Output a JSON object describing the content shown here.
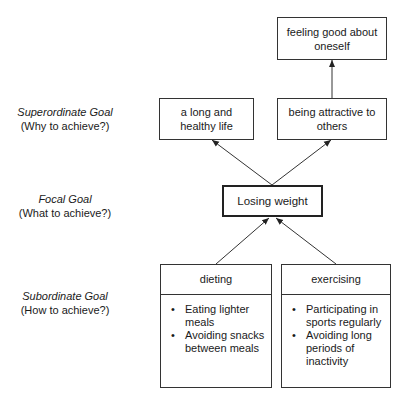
{
  "levels": {
    "superordinate": {
      "title": "Superordinate Goal",
      "question": "(Why to achieve?)"
    },
    "focal": {
      "title": "Focal Goal",
      "question": "(What to achieve?)"
    },
    "subordinate": {
      "title": "Subordinate Goal",
      "question": "(How to achieve?)"
    }
  },
  "nodes": {
    "feeling_good": "feeling good about oneself",
    "long_healthy_life": "a long and healthy life",
    "being_attractive": "being attractive to others",
    "losing_weight": "Losing weight"
  },
  "means": [
    {
      "title": "dieting",
      "items": [
        "Eating lighter meals",
        "Avoiding snacks between meals"
      ]
    },
    {
      "title": "exercising",
      "items": [
        "Participating in sports regularly",
        "Avoiding long periods of inactivity"
      ]
    }
  ],
  "edges": [
    {
      "from": "being_attractive",
      "to": "feeling_good"
    },
    {
      "from": "losing_weight",
      "to": "long_healthy_life"
    },
    {
      "from": "losing_weight",
      "to": "being_attractive"
    },
    {
      "from": "dieting",
      "to": "losing_weight"
    },
    {
      "from": "exercising",
      "to": "losing_weight"
    }
  ],
  "colors": {
    "line": "#333333",
    "text": "#1a1a1a",
    "background": "#ffffff"
  }
}
